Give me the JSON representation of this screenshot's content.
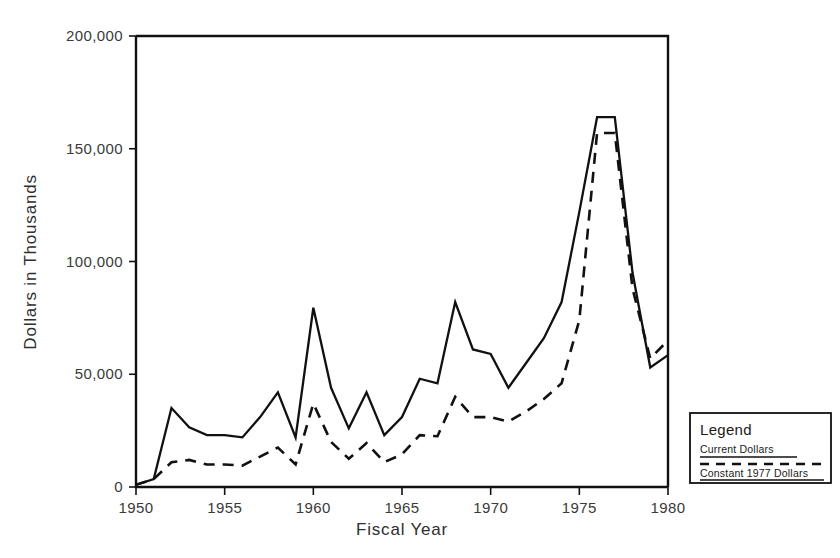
{
  "chart_data": {
    "type": "line",
    "title": "",
    "xlabel": "Fiscal Year",
    "ylabel": "Dollars in Thousands",
    "xlim": [
      1950,
      1980
    ],
    "ylim": [
      0,
      200000
    ],
    "xticks": [
      1950,
      1955,
      1960,
      1965,
      1970,
      1975,
      1980
    ],
    "xticklabels": [
      "1950",
      "1955",
      "1960",
      "1965",
      "1970",
      "1975",
      "1980"
    ],
    "yticks": [
      0,
      50000,
      100000,
      150000,
      200000
    ],
    "yticklabels": [
      "0",
      "50,000",
      "100,000",
      "150,000",
      "200,000"
    ],
    "grid": false,
    "legend_position": "outside-bottom-right",
    "x": [
      1950,
      1951,
      1952,
      1953,
      1954,
      1955,
      1956,
      1957,
      1958,
      1959,
      1960,
      1961,
      1962,
      1963,
      1964,
      1965,
      1966,
      1967,
      1968,
      1969,
      1970,
      1971,
      1972,
      1973,
      1974,
      1975,
      1976,
      1977,
      1978,
      1979,
      1980
    ],
    "series": [
      {
        "name": "Current Dollars",
        "style": "solid",
        "color": "#111111",
        "values": [
          1000,
          3500,
          35000,
          26500,
          23000,
          23000,
          22000,
          31000,
          42000,
          22000,
          79500,
          44000,
          26000,
          42000,
          23000,
          31000,
          48000,
          46000,
          82000,
          61000,
          59000,
          44000,
          55000,
          66000,
          82000,
          122000,
          164000,
          164000,
          95000,
          53000,
          58500
        ]
      },
      {
        "name": "Constant 1977 Dollars",
        "style": "dashed",
        "color": "#111111",
        "values": [
          1000,
          3500,
          11000,
          12000,
          10000,
          10000,
          9500,
          13500,
          17500,
          10000,
          37000,
          20000,
          12500,
          19500,
          11000,
          14500,
          23000,
          22500,
          40000,
          31000,
          31000,
          29000,
          33500,
          39000,
          46000,
          74000,
          157000,
          157000,
          88000,
          57000,
          65000
        ]
      }
    ]
  },
  "legend": {
    "title": "Legend",
    "entries": [
      {
        "label": "Current Dollars",
        "style": "solid"
      },
      {
        "label": "Constant 1977 Dollars",
        "style": "dashed"
      }
    ]
  }
}
